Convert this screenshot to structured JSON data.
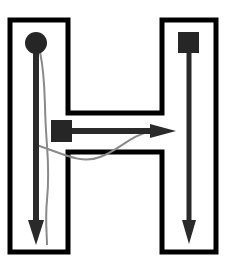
{
  "diagram": {
    "shape": "letter-H-outline",
    "colors": {
      "outline": "#000000",
      "arrow": "#2a2a2a",
      "marker": "#262626",
      "trace": "#8a8a8a",
      "background": "#ffffff"
    },
    "markers": [
      {
        "name": "start-circle",
        "type": "circle",
        "position": "top-left-column"
      },
      {
        "name": "start-square-middle",
        "type": "square",
        "position": "crossbar-left"
      },
      {
        "name": "start-square-right",
        "type": "square",
        "position": "top-right-column"
      }
    ],
    "arrows": [
      {
        "name": "left-column-down",
        "direction": "down"
      },
      {
        "name": "crossbar-right",
        "direction": "right"
      },
      {
        "name": "right-column-down",
        "direction": "down"
      }
    ],
    "traces": [
      {
        "name": "freehand-trace",
        "description": "thin gray wavy line down left column and across crossbar"
      }
    ]
  }
}
